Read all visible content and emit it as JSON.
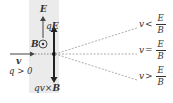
{
  "diagram": {
    "labels": {
      "E": "E",
      "qE_q": "q",
      "qE_E": "E",
      "B": "B",
      "v": "v",
      "charge": "q > 0",
      "force_qv": "qv",
      "force_x": "×",
      "force_B": "B"
    },
    "outcomes": [
      {
        "lhs": "v",
        "op": "<",
        "num": "E",
        "den": "B"
      },
      {
        "lhs": "v",
        "op": "=",
        "num": "E",
        "den": "B"
      },
      {
        "lhs": "v",
        "op": ">",
        "num": "E",
        "den": "B"
      }
    ],
    "colors": {
      "region": "#ebebeb",
      "ink": "#333333",
      "dashed": "#999999"
    }
  }
}
